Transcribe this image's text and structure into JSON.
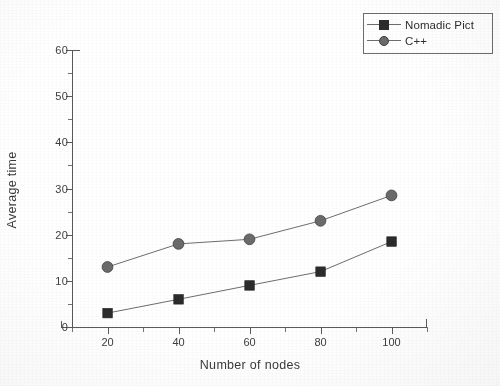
{
  "chart_data": {
    "type": "line",
    "title": "",
    "xlabel": "Number of nodes",
    "ylabel": "Average time",
    "x": [
      20,
      40,
      60,
      80,
      100
    ],
    "categories": [
      "20",
      "40",
      "60",
      "80",
      "100"
    ],
    "series": [
      {
        "name": "Nomadic Pict",
        "marker": "filled-square",
        "color": "#2b2b2b",
        "values": [
          3,
          6,
          9,
          12,
          18.5
        ]
      },
      {
        "name": "C++",
        "marker": "filled-circle",
        "color": "#6b6b6b",
        "values": [
          13,
          18,
          19,
          23,
          28.5
        ]
      }
    ],
    "xlim": [
      10,
      110
    ],
    "ylim": [
      0,
      60
    ],
    "xticks": [
      20,
      40,
      60,
      80,
      100
    ],
    "yticks": [
      0,
      10,
      20,
      30,
      40,
      50,
      60
    ],
    "xtick_labels": [
      "20",
      "40",
      "60",
      "80",
      "100"
    ],
    "ytick_labels": [
      "0",
      "10",
      "20",
      "30",
      "40",
      "50",
      "60"
    ],
    "minor_xticks": [
      10,
      30,
      50,
      70,
      90,
      110
    ],
    "minor_yticks": [
      5,
      15,
      25,
      35,
      45,
      55
    ],
    "grid": false,
    "legend_position": "top-right",
    "legend_border": true
  },
  "legend": {
    "entries": [
      {
        "label": "Nomadic Pict",
        "marker": "square-marker-icon"
      },
      {
        "label": "C++",
        "marker": "circle-marker-icon"
      }
    ]
  },
  "axes": {
    "x_title": "Number of nodes",
    "y_title": "Average time"
  },
  "colors": {
    "axis": "#5a5a5a",
    "text": "#3a3a3a",
    "series_a": "#2b2b2b",
    "series_b": "#6b6b6b",
    "line": "#6e6e6e",
    "background": "#ffffff"
  }
}
